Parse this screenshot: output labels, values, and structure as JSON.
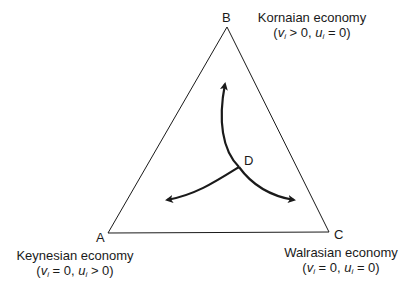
{
  "diagram": {
    "type": "triangle-phase-diagram",
    "vertices": [
      {
        "id": "A",
        "label": "A",
        "x": 108,
        "y": 233,
        "name": "Keynesian economy",
        "condition": {
          "v": "= 0",
          "u": "> 0"
        }
      },
      {
        "id": "B",
        "label": "B",
        "x": 227,
        "y": 27,
        "name": "Kornaian economy",
        "condition": {
          "v": "> 0",
          "u": "= 0"
        }
      },
      {
        "id": "C",
        "label": "C",
        "x": 329,
        "y": 232,
        "name": "Walrasian economy",
        "condition": {
          "v": "= 0",
          "u": "= 0"
        }
      }
    ],
    "center_point": {
      "label": "D",
      "x": 239,
      "y": 167
    },
    "arrows": [
      {
        "from": "D",
        "toward": "B"
      },
      {
        "from": "D",
        "toward": "A"
      },
      {
        "from": "D",
        "toward": "C"
      }
    ],
    "variables": {
      "v": "v",
      "u": "u",
      "subscript": "i"
    },
    "colors": {
      "line": "#1a1a1a",
      "background": "#ffffff"
    }
  }
}
